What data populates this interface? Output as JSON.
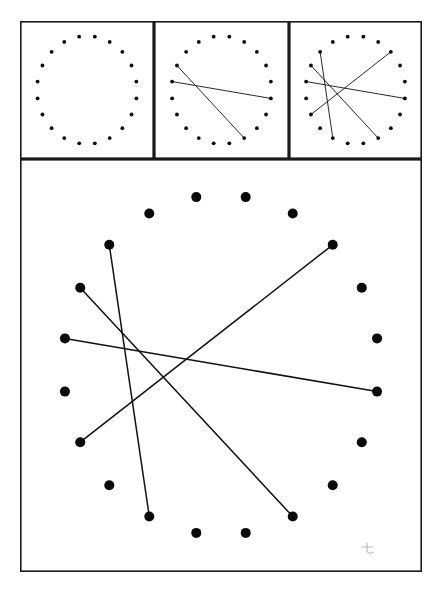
{
  "figure": {
    "background_color": "#ffffff",
    "ink_color": "#111111",
    "dot_color": "#0a0a0a",
    "frame_color": "#1a1a1a",
    "dot_count": 20,
    "panels": [
      {
        "name": "panel-1-dots-only",
        "label": "Step 1",
        "x": 20,
        "y": 21,
        "width": 134,
        "height": 138,
        "center_x": 87,
        "center_y": 90,
        "radius_x": 50,
        "radius_y": 54,
        "dot_radius": 1.9,
        "start_angle_deg": -99,
        "chord_pairs": []
      },
      {
        "name": "panel-2-two-chords",
        "label": "Step 2",
        "x": 154,
        "y": 21,
        "width": 135,
        "height": 138,
        "center_x": 221.5,
        "center_y": 90,
        "radius_x": 50,
        "radius_y": 54,
        "dot_radius": 1.9,
        "start_angle_deg": -99,
        "chord_pairs": [
          [
            16,
            6
          ],
          [
            17,
            9
          ]
        ]
      },
      {
        "name": "panel-3-four-chords",
        "label": "Step 3",
        "x": 289,
        "y": 21,
        "width": 133,
        "height": 138,
        "center_x": 355.5,
        "center_y": 90,
        "radius_x": 50,
        "radius_y": 54,
        "dot_radius": 1.9,
        "start_angle_deg": -99,
        "chord_pairs": [
          [
            16,
            6
          ],
          [
            17,
            9
          ],
          [
            18,
            12
          ],
          [
            14,
            3
          ]
        ]
      },
      {
        "name": "panel-4-main-large",
        "label": "Large figure",
        "x": 20,
        "y": 159,
        "width": 402,
        "height": 413,
        "center_x": 221,
        "center_y": 365,
        "radius_x": 158,
        "radius_y": 170,
        "dot_radius": 5.0,
        "start_angle_deg": -99,
        "chord_pairs": [
          [
            16,
            6
          ],
          [
            17,
            9
          ],
          [
            18,
            12
          ],
          [
            14,
            3
          ]
        ]
      }
    ],
    "stray_mark": {
      "name": "pencil-stray-mark",
      "x": 366,
      "y": 542,
      "width": 12,
      "height": 13,
      "color": "#b9b9b9"
    }
  }
}
